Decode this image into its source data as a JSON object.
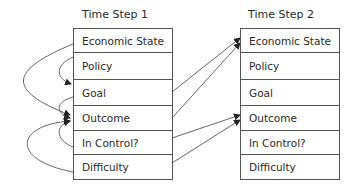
{
  "diagram": {
    "type": "dynamic-bayesian-network-slices",
    "time_steps": [
      {
        "title": "Time Step 1",
        "nodes": [
          "Economic State",
          "Policy",
          "Goal",
          "Outcome",
          "In Control?",
          "Difficulty"
        ]
      },
      {
        "title": "Time Step 2",
        "nodes": [
          "Economic State",
          "Policy",
          "Goal",
          "Outcome",
          "In Control?",
          "Difficulty"
        ]
      }
    ],
    "edges": [
      {
        "from": "t1.Economic State",
        "to": "t1.Outcome",
        "kind": "intra-slice"
      },
      {
        "from": "t1.Policy",
        "to": "t1.Goal",
        "kind": "intra-slice"
      },
      {
        "from": "t1.Goal",
        "to": "t1.Outcome",
        "kind": "intra-slice"
      },
      {
        "from": "t1.In Control?",
        "to": "t1.Outcome",
        "kind": "intra-slice"
      },
      {
        "from": "t1.Difficulty",
        "to": "t1.Outcome",
        "kind": "intra-slice"
      },
      {
        "from": "t1.Goal",
        "to": "t2.Economic State",
        "kind": "inter-slice"
      },
      {
        "from": "t1.Outcome",
        "to": "t2.Economic State",
        "kind": "inter-slice"
      },
      {
        "from": "t1.In Control?",
        "to": "t2.Outcome",
        "kind": "inter-slice"
      },
      {
        "from": "t1.Difficulty",
        "to": "t2.Outcome",
        "kind": "inter-slice"
      }
    ],
    "colors": {
      "line": "#555555",
      "text": "#2a2a2a",
      "background": "#ffffff"
    }
  }
}
